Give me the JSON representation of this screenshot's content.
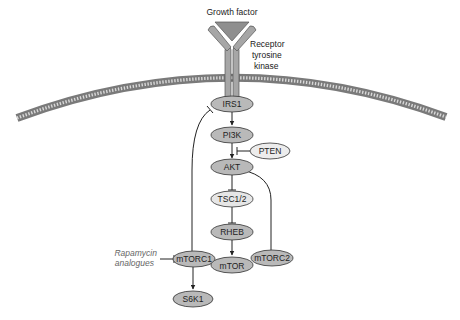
{
  "diagram": {
    "labels": {
      "growth_factor": "Growth factor",
      "receptor_line1": "Receptor",
      "receptor_line2": "tyrosine",
      "receptor_line3": "kinase",
      "drug_line1": "Rapamycin",
      "drug_line2": "analogues"
    },
    "nodes": {
      "irs1": "IRS1",
      "pi3k": "PI3K",
      "pten": "PTEN",
      "akt": "AKT",
      "tsc": "TSC1/2",
      "rheb": "RHEB",
      "mtorc1": "mTORC1",
      "mtor": "mTOR",
      "mtorc2": "mTORC2",
      "s6k1": "S6K1"
    },
    "edges": [
      {
        "from": "IRS1",
        "to": "PI3K",
        "type": "activation"
      },
      {
        "from": "PI3K",
        "to": "AKT",
        "type": "activation"
      },
      {
        "from": "PTEN",
        "to": "PI3K-AKT",
        "type": "inhibition"
      },
      {
        "from": "AKT",
        "to": "TSC1/2",
        "type": "inhibition"
      },
      {
        "from": "TSC1/2",
        "to": "RHEB",
        "type": "inhibition"
      },
      {
        "from": "RHEB",
        "to": "mTOR",
        "type": "activation"
      },
      {
        "from": "mTORC1",
        "to": "S6K1",
        "type": "activation"
      },
      {
        "from": "mTORC1",
        "to": "IRS1",
        "type": "inhibition"
      },
      {
        "from": "mTORC2",
        "to": "AKT",
        "type": "activation"
      },
      {
        "from": "Rapamycin analogues",
        "to": "mTORC1",
        "type": "inhibition"
      }
    ],
    "colors": {
      "dark_node": "#b9b9b9",
      "light_node": "#e6e6e6",
      "stroke": "#333333",
      "membrane": "#8a8a8a"
    }
  }
}
